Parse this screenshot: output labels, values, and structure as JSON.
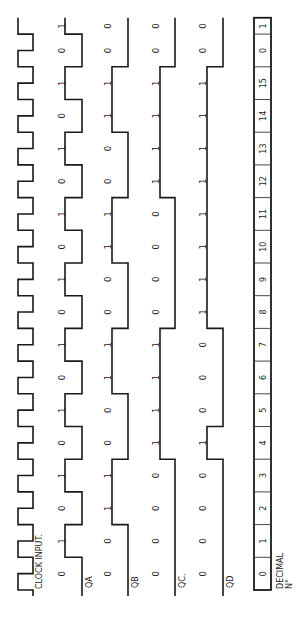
{
  "diagram": {
    "type": "timing-diagram",
    "orientation": "rotated-90-ccw",
    "colors": {
      "line": "#1a1a1a",
      "text": "#222222",
      "background": "#ffffff"
    },
    "clock": {
      "label": "CLOCK INPUT.",
      "cycles": 17.5
    },
    "signals": [
      {
        "id": "qa",
        "label": "QA",
        "values": [
          "0",
          "1",
          "0",
          "1",
          "0",
          "1",
          "0",
          "1",
          "0",
          "1",
          "0",
          "1",
          "0",
          "1",
          "0",
          "1",
          "0",
          "1"
        ]
      },
      {
        "id": "qb",
        "label": "QB",
        "values": [
          "0",
          "0",
          "1",
          "1",
          "0",
          "0",
          "1",
          "1",
          "0",
          "0",
          "1",
          "1",
          "0",
          "0",
          "1",
          "1",
          "0",
          "0"
        ]
      },
      {
        "id": "qc",
        "label": "QC.",
        "values": [
          "0",
          "0",
          "0",
          "0",
          "1",
          "1",
          "1",
          "1",
          "0",
          "0",
          "0",
          "0",
          "1",
          "1",
          "1",
          "1",
          "0",
          "0"
        ]
      },
      {
        "id": "qd",
        "label": "QD",
        "values": [
          "0",
          "0",
          "0",
          "0",
          "1",
          "0",
          "0",
          "0",
          "1",
          "1",
          "1",
          "1",
          "1",
          "1",
          "1",
          "1",
          "0",
          "0"
        ]
      }
    ],
    "decimal": {
      "label_line1": "DECIMAL",
      "label_line2": "N°",
      "cells": [
        "0",
        "1",
        "2",
        "3",
        "4",
        "5",
        "6",
        "7",
        "8",
        "9",
        "10",
        "11",
        "12",
        "13",
        "14",
        "15",
        "0",
        "1"
      ]
    }
  }
}
